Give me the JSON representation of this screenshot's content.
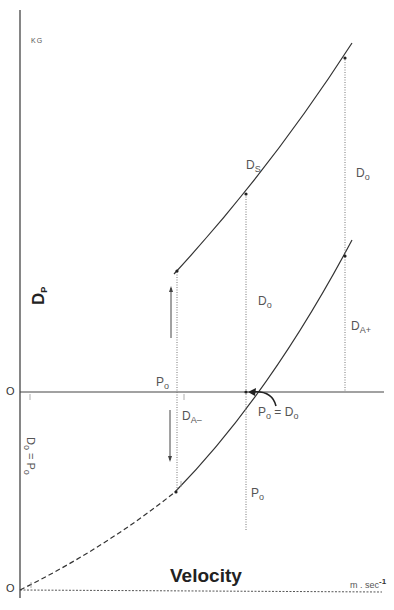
{
  "diagram": {
    "title": "",
    "y_axis": {
      "label_main": "D",
      "label_sub": "P",
      "unit": "KG",
      "zero_label_upper": "O",
      "zero_label_lower": "O",
      "side_equation_main": "D",
      "side_equation_sub": "o",
      "side_equation_rest": " = P",
      "side_equation_rest_sub": "o"
    },
    "x_axis": {
      "label": "Velocity",
      "unit": "m . sec",
      "unit_exp": "-1"
    },
    "curves": [
      {
        "name": "D_S",
        "label_main": "D",
        "label_sub": "S",
        "style": "solid"
      },
      {
        "name": "D_A",
        "style": "solid-with-dashed-extension"
      }
    ],
    "labels": {
      "ds": {
        "main": "D",
        "sub": "S"
      },
      "do_right": {
        "main": "D",
        "sub": "o"
      },
      "do_middle": {
        "main": "D",
        "sub": "o"
      },
      "da_plus": {
        "main": "D",
        "sub": "A+"
      },
      "da_minus": {
        "main": "D",
        "sub": "A–"
      },
      "po_left": {
        "main": "P",
        "sub": "o"
      },
      "po_bottom": {
        "main": "P",
        "sub": "o"
      },
      "po_eq_do": {
        "main1": "P",
        "sub1": "o",
        "eq": " = ",
        "main2": "D",
        "sub2": "o"
      }
    },
    "colors": {
      "line": "#333333",
      "axis": "#444444",
      "dotted": "#777777",
      "text": "#555555"
    }
  }
}
